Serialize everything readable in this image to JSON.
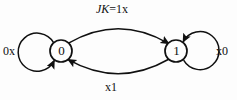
{
  "diagram": {
    "states": [
      {
        "id": "state-0",
        "label": "0",
        "cx": 61,
        "cy": 51,
        "r": 11
      },
      {
        "id": "state-1",
        "label": "1",
        "cx": 176,
        "cy": 51,
        "r": 11
      }
    ],
    "transitions": [
      {
        "id": "self-loop-0",
        "from": "0",
        "to": "0",
        "label": "0x",
        "position": "left"
      },
      {
        "id": "self-loop-1",
        "from": "1",
        "to": "1",
        "label": "x0",
        "position": "right"
      },
      {
        "id": "arc-0-to-1",
        "from": "0",
        "to": "1",
        "label_italic": "JK",
        "label_rest": "=1x",
        "label": "JK=1x",
        "position": "top"
      },
      {
        "id": "arc-1-to-0",
        "from": "1",
        "to": "0",
        "label": "x1",
        "position": "bottom"
      }
    ],
    "colors": {
      "stroke": "#101010",
      "text": "#101010",
      "background": "#fdfdfd"
    }
  }
}
